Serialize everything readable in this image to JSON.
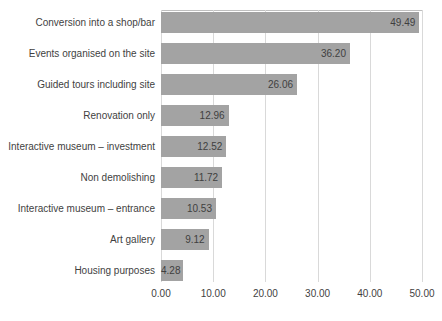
{
  "chart_data": {
    "type": "bar",
    "orientation": "horizontal",
    "title": "",
    "xlabel": "",
    "ylabel": "",
    "xlim": [
      0,
      50
    ],
    "grid": true,
    "legend": false,
    "bar_color": "#a3a3a3",
    "gridline_color": "#d9d9d9",
    "categories": [
      "Conversion into a shop/bar",
      "Events organised on the site",
      "Guided tours including site",
      "Renovation only",
      "Interactive museum – investment",
      "Non demolishing",
      "Interactive museum – entrance",
      "Art gallery",
      "Housing purposes"
    ],
    "values": [
      49.49,
      36.2,
      26.06,
      12.96,
      12.52,
      11.72,
      10.53,
      9.12,
      4.28
    ],
    "value_labels": [
      "49.49",
      "36.20",
      "26.06",
      "12.96",
      "12.52",
      "11.72",
      "10.53",
      "9.12",
      "4.28"
    ],
    "xticks": [
      0,
      10,
      20,
      30,
      40,
      50
    ],
    "xtick_labels": [
      "0.00",
      "10.00",
      "20.00",
      "30.00",
      "40.00",
      "50.00"
    ]
  }
}
